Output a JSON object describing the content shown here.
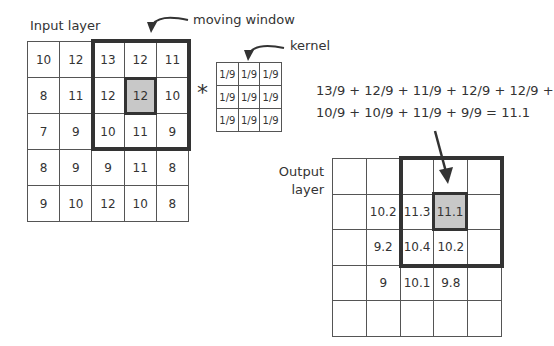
{
  "labels": {
    "input_layer": "Input layer",
    "moving_window": "moving window",
    "kernel": "kernel",
    "output_layer_line1": "Output",
    "output_layer_line2": "layer",
    "operator": "*"
  },
  "formula": {
    "line1": "13/9 + 12/9 + 11/9 + 12/9 + 12/9 +",
    "line2": "10/9 + 10/9 + 11/9 + 9/9 = 11.1"
  },
  "input_grid": {
    "rows": [
      [
        "10",
        "12",
        "13",
        "12",
        "11"
      ],
      [
        "8",
        "11",
        "12",
        "12",
        "10"
      ],
      [
        "7",
        "9",
        "10",
        "11",
        "9"
      ],
      [
        "8",
        "9",
        "9",
        "11",
        "8"
      ],
      [
        "9",
        "10",
        "12",
        "10",
        "8"
      ]
    ],
    "window": {
      "row_start": 0,
      "col_start": 2,
      "size": 3
    },
    "center": {
      "row": 1,
      "col": 3,
      "value": "12"
    }
  },
  "kernel": {
    "rows": [
      [
        "1/9",
        "1/9",
        "1/9"
      ],
      [
        "1/9",
        "1/9",
        "1/9"
      ],
      [
        "1/9",
        "1/9",
        "1/9"
      ]
    ]
  },
  "output_grid": {
    "rows": [
      [
        "",
        "",
        "",
        "",
        ""
      ],
      [
        "",
        "10.2",
        "11.3",
        "11.1",
        ""
      ],
      [
        "",
        "9.2",
        "10.4",
        "10.2",
        ""
      ],
      [
        "",
        "9",
        "10.1",
        "9.8",
        ""
      ],
      [
        "",
        "",
        "",
        "",
        ""
      ]
    ],
    "window": {
      "row_start": 0,
      "col_start": 2,
      "size": 3
    },
    "center": {
      "row": 1,
      "col": 3,
      "value": "11.1"
    }
  },
  "colors": {
    "highlight_fill": "#c8c8c8",
    "border_dark": "#333333",
    "grid_line": "#555555"
  }
}
